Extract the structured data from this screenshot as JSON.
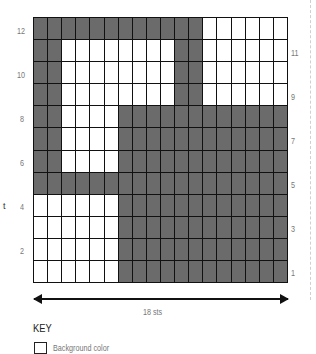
{
  "chart": {
    "columns": 18,
    "rows": 12,
    "colors": {
      "background": "#ffffff",
      "contrast": "#6b6b6b",
      "grid_line": "#111111"
    },
    "pattern_top_to_bottom": [
      "DDDDDDDDDDDDWWWWWW",
      "DDWWWWWWWWDDWWWWWW",
      "DDWWWWWWWWDDWWWWWW",
      "DDWWWWWWWWDDWWWWWW",
      "DDWWWWDDDDDDDDDDDD",
      "DDWWWWDDDDDDDDDDDD",
      "DDWWWWDDDDDDDDDDDD",
      "DDDDDDDDDDDDDDDDDD",
      "WWWWWWDDDDDDDDDDDD",
      "WWWWWWDDDDDDDDDDDD",
      "WWWWWWDDDDDDDDDDDD",
      "WWWWWWDDDDDDDDDDDD"
    ],
    "left_row_labels": [
      "12",
      "10",
      "8",
      "6",
      "4",
      "2"
    ],
    "right_row_labels": [
      "11",
      "9",
      "7",
      "5",
      "3",
      "1"
    ]
  },
  "width_label": "18 sts",
  "side_fragment": "t",
  "key": {
    "title": "KEY",
    "items": [
      {
        "swatch": "#ffffff",
        "label": "Background color"
      }
    ]
  }
}
